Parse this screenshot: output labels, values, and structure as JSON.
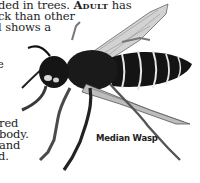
{
  "body_text": {
    "lines": [
      {
        "pre": "ded in trees. ",
        "bold": "Adult",
        "post": " has"
      },
      {
        "pre": "ck than other",
        "bold": "",
        "post": ""
      },
      {
        "pre": "l shows a",
        "bold": "",
        "post": ""
      },
      {
        "pre": "e",
        "bold": "",
        "post": ""
      },
      {
        "pre": "red",
        "bold": "",
        "post": ""
      },
      {
        "pre": "body.",
        "bold": "",
        "post": ""
      },
      {
        "pre": "and",
        "bold": "",
        "post": ""
      },
      {
        "pre": "d.",
        "bold": "",
        "post": ""
      }
    ]
  },
  "illustration": {
    "subject": "wasp-illustration",
    "caption": "Median Wasp",
    "colors": {
      "body": "#141414",
      "stripe": "#e6e6e6",
      "wing": "#cfcfcf",
      "leg": "#5a5a5a"
    }
  }
}
